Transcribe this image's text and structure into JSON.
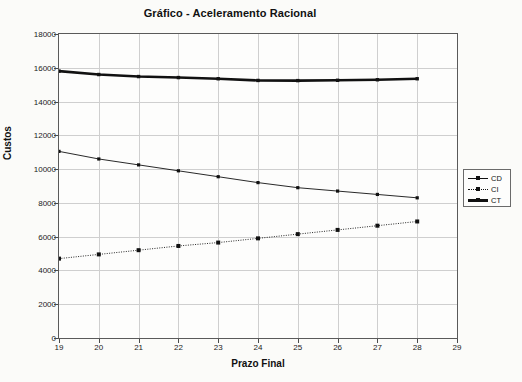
{
  "chart_data": {
    "type": "line",
    "title": "Gráfico - Aceleramento Racional",
    "xlabel": "Prazo Final",
    "ylabel": "Custos",
    "xlim": [
      19,
      29
    ],
    "ylim": [
      0,
      18000
    ],
    "xticks": [
      19,
      20,
      21,
      22,
      23,
      24,
      25,
      26,
      27,
      28,
      29
    ],
    "yticks": [
      0,
      2000,
      4000,
      6000,
      8000,
      10000,
      12000,
      14000,
      16000,
      18000
    ],
    "grid": true,
    "legend_position": "right",
    "x": [
      19,
      20,
      21,
      22,
      23,
      24,
      25,
      26,
      27,
      28
    ],
    "series": [
      {
        "name": "CD",
        "style": "solid-thin-marker",
        "color": "#111111",
        "values": [
          11050,
          10600,
          10250,
          9900,
          9550,
          9200,
          8900,
          8700,
          8500,
          8300
        ]
      },
      {
        "name": "CI",
        "style": "dotted-marker",
        "color": "#111111",
        "values": [
          4700,
          4950,
          5200,
          5450,
          5650,
          5900,
          6150,
          6400,
          6650,
          6900
        ]
      },
      {
        "name": "CT",
        "style": "solid-thick",
        "color": "#111111",
        "values": [
          15800,
          15600,
          15480,
          15420,
          15350,
          15250,
          15240,
          15260,
          15290,
          15350
        ]
      }
    ]
  },
  "legend": {
    "items": [
      {
        "label": "CD"
      },
      {
        "label": "CI"
      },
      {
        "label": "CT"
      }
    ]
  }
}
